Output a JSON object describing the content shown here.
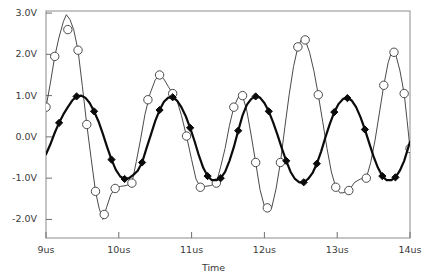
{
  "chart_data": {
    "type": "line",
    "title": "",
    "xlabel": "Time",
    "ylabel": "",
    "xlim": [
      9,
      14
    ],
    "ylim": [
      -2.45,
      3.05
    ],
    "grid": false,
    "legend": "none",
    "x_unit": "us",
    "y_unit": "V",
    "xticks": [
      9,
      10,
      11,
      12,
      13,
      14
    ],
    "xtick_labels": [
      "9us",
      "10us",
      "11us",
      "12us",
      "13us",
      "14us"
    ],
    "yticks": [
      3.0,
      2.0,
      1.0,
      0.0,
      -1.0,
      -2.0
    ],
    "ytick_labels": [
      "3.0V",
      "2.0V",
      "1.0V",
      "0.0V",
      "-1.0V",
      "-2.0V"
    ],
    "series": [
      {
        "name": "thin-trace",
        "color": "#4a4a4a",
        "line_width": 1.0,
        "marker": "open-circle",
        "marker_size": 4.2,
        "points": [
          [
            9.0,
            0.72
          ],
          [
            9.06,
            1.3
          ],
          [
            9.12,
            1.95
          ],
          [
            9.18,
            2.42
          ],
          [
            9.24,
            2.8
          ],
          [
            9.28,
            2.96
          ],
          [
            9.33,
            2.84
          ],
          [
            9.38,
            2.6
          ],
          [
            9.44,
            2.1
          ],
          [
            9.5,
            1.22
          ],
          [
            9.56,
            0.3
          ],
          [
            9.62,
            -0.52
          ],
          [
            9.68,
            -1.32
          ],
          [
            9.73,
            -1.73
          ],
          [
            9.78,
            -2.0
          ],
          [
            9.83,
            -1.72
          ],
          [
            9.89,
            -1.4
          ],
          [
            9.95,
            -1.25
          ],
          [
            10.02,
            -1.2
          ],
          [
            10.1,
            -1.18
          ],
          [
            10.18,
            -1.12
          ],
          [
            10.24,
            -0.6
          ],
          [
            10.3,
            -0.05
          ],
          [
            10.36,
            0.55
          ],
          [
            10.43,
            1.05
          ],
          [
            10.5,
            1.38
          ],
          [
            10.56,
            1.5
          ],
          [
            10.62,
            1.4
          ],
          [
            10.68,
            1.22
          ],
          [
            10.74,
            1.05
          ],
          [
            10.8,
            0.88
          ],
          [
            10.86,
            0.52
          ],
          [
            10.93,
            0.02
          ],
          [
            11.0,
            -0.55
          ],
          [
            11.06,
            -1.02
          ],
          [
            11.12,
            -1.22
          ],
          [
            11.18,
            -1.2
          ],
          [
            11.26,
            -1.18
          ],
          [
            11.34,
            -1.12
          ],
          [
            11.4,
            -0.72
          ],
          [
            11.46,
            -0.28
          ],
          [
            11.52,
            0.28
          ],
          [
            11.58,
            0.72
          ],
          [
            11.64,
            0.96
          ],
          [
            11.7,
            1.0
          ],
          [
            11.76,
            0.62
          ],
          [
            11.82,
            0.02
          ],
          [
            11.88,
            -0.62
          ],
          [
            11.94,
            -1.28
          ],
          [
            12.0,
            -1.68
          ],
          [
            12.04,
            -1.72
          ],
          [
            12.1,
            -1.72
          ],
          [
            12.16,
            -1.26
          ],
          [
            12.22,
            -0.62
          ],
          [
            12.28,
            0.22
          ],
          [
            12.34,
            1.02
          ],
          [
            12.4,
            1.7
          ],
          [
            12.46,
            2.18
          ],
          [
            12.52,
            2.4
          ],
          [
            12.56,
            2.35
          ],
          [
            12.62,
            2.05
          ],
          [
            12.68,
            1.6
          ],
          [
            12.74,
            1.02
          ],
          [
            12.8,
            0.38
          ],
          [
            12.86,
            -0.28
          ],
          [
            12.92,
            -0.85
          ],
          [
            12.98,
            -1.22
          ],
          [
            13.04,
            -1.36
          ],
          [
            13.1,
            -1.35
          ],
          [
            13.16,
            -1.3
          ],
          [
            13.24,
            -1.1
          ],
          [
            13.32,
            -1.02
          ],
          [
            13.4,
            -1.0
          ],
          [
            13.46,
            -0.62
          ],
          [
            13.52,
            -0.08
          ],
          [
            13.58,
            0.58
          ],
          [
            13.64,
            1.25
          ],
          [
            13.7,
            1.8
          ],
          [
            13.75,
            2.08
          ],
          [
            13.8,
            2.02
          ],
          [
            13.86,
            1.62
          ],
          [
            13.92,
            1.05
          ],
          [
            13.96,
            0.4
          ],
          [
            14.0,
            -0.28
          ]
        ],
        "marker_points": [
          [
            9.0,
            0.72
          ],
          [
            9.12,
            1.95
          ],
          [
            9.3,
            2.6
          ],
          [
            9.44,
            2.1
          ],
          [
            9.56,
            0.3
          ],
          [
            9.68,
            -1.32
          ],
          [
            9.8,
            -1.88
          ],
          [
            9.95,
            -1.25
          ],
          [
            10.18,
            -1.12
          ],
          [
            10.4,
            0.9
          ],
          [
            10.56,
            1.5
          ],
          [
            10.74,
            1.05
          ],
          [
            10.93,
            0.02
          ],
          [
            11.12,
            -1.22
          ],
          [
            11.34,
            -1.12
          ],
          [
            11.58,
            0.72
          ],
          [
            11.7,
            1.0
          ],
          [
            11.88,
            -0.62
          ],
          [
            12.04,
            -1.72
          ],
          [
            12.22,
            -0.62
          ],
          [
            12.46,
            2.18
          ],
          [
            12.56,
            2.35
          ],
          [
            12.74,
            1.02
          ],
          [
            12.98,
            -1.22
          ],
          [
            13.16,
            -1.3
          ],
          [
            13.4,
            -1.0
          ],
          [
            13.64,
            1.25
          ],
          [
            13.78,
            2.05
          ],
          [
            13.92,
            1.05
          ],
          [
            14.0,
            -0.28
          ]
        ]
      },
      {
        "name": "thick-trace",
        "color": "#0b0b0b",
        "line_width": 2.2,
        "marker": "filled-diamond",
        "marker_size": 3.6,
        "points": [
          [
            9.0,
            -0.42
          ],
          [
            9.06,
            -0.18
          ],
          [
            9.12,
            0.1
          ],
          [
            9.18,
            0.34
          ],
          [
            9.24,
            0.55
          ],
          [
            9.3,
            0.72
          ],
          [
            9.36,
            0.88
          ],
          [
            9.42,
            0.98
          ],
          [
            9.48,
            1.0
          ],
          [
            9.54,
            0.95
          ],
          [
            9.6,
            0.82
          ],
          [
            9.66,
            0.62
          ],
          [
            9.72,
            0.38
          ],
          [
            9.78,
            0.08
          ],
          [
            9.84,
            -0.25
          ],
          [
            9.9,
            -0.55
          ],
          [
            9.96,
            -0.8
          ],
          [
            10.02,
            -0.96
          ],
          [
            10.08,
            -1.02
          ],
          [
            10.14,
            -1.0
          ],
          [
            10.2,
            -0.92
          ],
          [
            10.26,
            -0.82
          ],
          [
            10.32,
            -0.62
          ],
          [
            10.38,
            -0.28
          ],
          [
            10.44,
            0.05
          ],
          [
            10.5,
            0.38
          ],
          [
            10.56,
            0.65
          ],
          [
            10.62,
            0.85
          ],
          [
            10.68,
            0.95
          ],
          [
            10.74,
            0.96
          ],
          [
            10.8,
            0.88
          ],
          [
            10.86,
            0.72
          ],
          [
            10.92,
            0.5
          ],
          [
            10.98,
            0.22
          ],
          [
            11.04,
            -0.1
          ],
          [
            11.1,
            -0.45
          ],
          [
            11.16,
            -0.75
          ],
          [
            11.22,
            -0.95
          ],
          [
            11.28,
            -1.05
          ],
          [
            11.34,
            -1.05
          ],
          [
            11.4,
            -1.0
          ],
          [
            11.46,
            -0.85
          ],
          [
            11.52,
            -0.58
          ],
          [
            11.58,
            -0.25
          ],
          [
            11.64,
            0.15
          ],
          [
            11.7,
            0.52
          ],
          [
            11.76,
            0.78
          ],
          [
            11.82,
            0.92
          ],
          [
            11.88,
            0.98
          ],
          [
            11.94,
            0.95
          ],
          [
            12.0,
            0.82
          ],
          [
            12.06,
            0.62
          ],
          [
            12.12,
            0.35
          ],
          [
            12.18,
            0.05
          ],
          [
            12.24,
            -0.28
          ],
          [
            12.3,
            -0.58
          ],
          [
            12.36,
            -0.85
          ],
          [
            12.42,
            -1.02
          ],
          [
            12.48,
            -1.1
          ],
          [
            12.54,
            -1.1
          ],
          [
            12.6,
            -1.02
          ],
          [
            12.66,
            -0.88
          ],
          [
            12.72,
            -0.65
          ],
          [
            12.78,
            -0.35
          ],
          [
            12.84,
            0.0
          ],
          [
            12.9,
            0.32
          ],
          [
            12.96,
            0.6
          ],
          [
            13.02,
            0.8
          ],
          [
            13.08,
            0.92
          ],
          [
            13.14,
            0.94
          ],
          [
            13.2,
            0.88
          ],
          [
            13.26,
            0.72
          ],
          [
            13.32,
            0.48
          ],
          [
            13.38,
            0.18
          ],
          [
            13.44,
            -0.15
          ],
          [
            13.5,
            -0.48
          ],
          [
            13.56,
            -0.75
          ],
          [
            13.62,
            -0.95
          ],
          [
            13.68,
            -1.05
          ],
          [
            13.74,
            -1.05
          ],
          [
            13.8,
            -0.98
          ],
          [
            13.86,
            -0.82
          ],
          [
            13.92,
            -0.58
          ],
          [
            13.96,
            -0.35
          ],
          [
            14.0,
            -0.12
          ]
        ],
        "marker_points": [
          [
            9.18,
            0.34
          ],
          [
            9.42,
            0.98
          ],
          [
            9.66,
            0.62
          ],
          [
            9.9,
            -0.55
          ],
          [
            10.08,
            -1.02
          ],
          [
            10.32,
            -0.62
          ],
          [
            10.56,
            0.65
          ],
          [
            10.74,
            0.96
          ],
          [
            10.98,
            0.22
          ],
          [
            11.22,
            -0.95
          ],
          [
            11.4,
            -1.0
          ],
          [
            11.64,
            0.15
          ],
          [
            11.88,
            0.98
          ],
          [
            12.06,
            0.62
          ],
          [
            12.3,
            -0.58
          ],
          [
            12.54,
            -1.1
          ],
          [
            12.72,
            -0.65
          ],
          [
            12.96,
            0.6
          ],
          [
            13.14,
            0.94
          ],
          [
            13.38,
            0.18
          ],
          [
            13.62,
            -0.95
          ],
          [
            13.8,
            -0.98
          ]
        ]
      }
    ]
  },
  "axes": {
    "frame_color": "#8c8c8c",
    "tick_color": "#6e6e6e",
    "label_color": "#3a3a3a"
  },
  "footer": {
    "note": ""
  }
}
